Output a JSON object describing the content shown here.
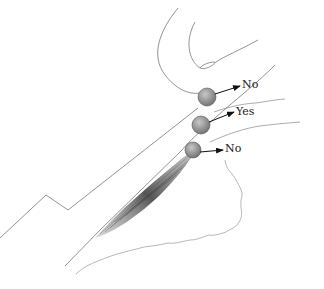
{
  "diagram": {
    "type": "anatomical-illustration",
    "labels": [
      {
        "id": "label-top",
        "text": "No",
        "x": 242,
        "y": 80
      },
      {
        "id": "label-middle",
        "text": "Yes",
        "x": 237,
        "y": 104
      },
      {
        "id": "label-bottom",
        "text": "No",
        "x": 226,
        "y": 143
      }
    ],
    "spheres": [
      {
        "id": "sphere-top",
        "cx": 207,
        "cy": 97,
        "r": 9
      },
      {
        "id": "sphere-middle",
        "cx": 201,
        "cy": 125,
        "r": 9
      },
      {
        "id": "sphere-bottom",
        "cx": 193,
        "cy": 150,
        "r": 8
      }
    ],
    "colors": {
      "line": "#777777",
      "sphere": "#8a8a8a",
      "arrow": "#111111",
      "muscle": "#555555"
    }
  }
}
